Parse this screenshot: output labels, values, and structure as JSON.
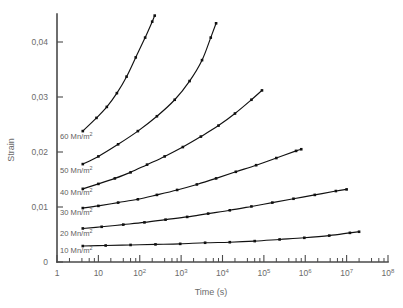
{
  "chart_data": {
    "type": "line",
    "title": "",
    "xlabel": "Time (s)",
    "ylabel": "Strain",
    "xscale": "log",
    "yscale": "linear",
    "xlim": [
      1,
      100000000
    ],
    "ylim": [
      0,
      0.045
    ],
    "xtick_labels": [
      "1",
      "10",
      "10²",
      "10³",
      "10⁴",
      "10⁵",
      "10⁶",
      "10⁷",
      "10⁸"
    ],
    "xtick_mantissas": [
      "1",
      "10",
      "10",
      "10",
      "10",
      "10",
      "10",
      "10",
      "10"
    ],
    "xtick_exponents": [
      "",
      "",
      "2",
      "3",
      "4",
      "5",
      "6",
      "7",
      "8"
    ],
    "xtick_values": [
      1,
      10,
      100,
      1000,
      10000,
      100000,
      1000000,
      10000000,
      100000000
    ],
    "ytick_labels": [
      "0",
      "0,01",
      "0,02",
      "0,03",
      "0,04"
    ],
    "ytick_values": [
      0,
      0.01,
      0.02,
      0.03,
      0.04
    ],
    "grid": false,
    "legend_position": "inline-left-of-curves",
    "marker": "square",
    "line_color": "#111111",
    "series": [
      {
        "name": "60 Mn/m²",
        "label_value": "60",
        "label_unit": "Mn/m",
        "label_exponent": "2",
        "x": [
          4.2,
          9,
          16,
          28,
          48,
          80,
          135,
          200,
          230
        ],
        "y": [
          0.0238,
          0.0262,
          0.0282,
          0.0307,
          0.0337,
          0.0372,
          0.0408,
          0.0437,
          0.0448
        ]
      },
      {
        "name": "50 Mn/m²",
        "label_value": "50",
        "label_unit": "Mn/m",
        "label_exponent": "2",
        "x": [
          4.2,
          10,
          30,
          90,
          260,
          700,
          1600,
          3200,
          5200,
          7000
        ],
        "y": [
          0.0178,
          0.0192,
          0.0214,
          0.0238,
          0.0265,
          0.0295,
          0.0329,
          0.0367,
          0.0408,
          0.0434
        ]
      },
      {
        "name": "40 Mn/m²",
        "label_value": "40",
        "label_unit": "Mn/m",
        "label_exponent": "2",
        "x": [
          4.2,
          10,
          25,
          60,
          150,
          400,
          1100,
          3000,
          8000,
          20000,
          50000,
          90000
        ],
        "y": [
          0.0133,
          0.0142,
          0.0152,
          0.0163,
          0.0177,
          0.0192,
          0.0209,
          0.0228,
          0.0248,
          0.027,
          0.0295,
          0.0312
        ]
      },
      {
        "name": "30 Mn/m²",
        "label_value": "30",
        "label_unit": "Mn/m",
        "label_exponent": "2",
        "x": [
          4.2,
          10,
          30,
          90,
          260,
          800,
          2400,
          7000,
          21000,
          65000,
          200000,
          600000,
          800000
        ],
        "y": [
          0.0098,
          0.0102,
          0.0108,
          0.0114,
          0.0122,
          0.0131,
          0.0141,
          0.0152,
          0.0164,
          0.0176,
          0.0189,
          0.0202,
          0.0205
        ]
      },
      {
        "name": "20 Mn/m²",
        "label_value": "20",
        "label_unit": "Mn/m",
        "label_exponent": "2",
        "x": [
          4.2,
          12,
          40,
          130,
          420,
          1400,
          4500,
          15000,
          50000,
          160000,
          520000,
          1700000,
          5500000,
          10000000
        ],
        "y": [
          0.0061,
          0.0064,
          0.0068,
          0.0072,
          0.0077,
          0.0082,
          0.0088,
          0.0094,
          0.0101,
          0.0108,
          0.0115,
          0.0122,
          0.0129,
          0.0132
        ]
      },
      {
        "name": "10 Mn/m²",
        "label_value": "10",
        "label_unit": "Mn/m",
        "label_exponent": "2",
        "x": [
          4.2,
          15,
          60,
          240,
          950,
          3800,
          15000,
          60000,
          240000,
          950000,
          3800000,
          12000000,
          20000000
        ],
        "y": [
          0.0029,
          0.003,
          0.0031,
          0.0032,
          0.0033,
          0.0035,
          0.0036,
          0.0038,
          0.0041,
          0.0044,
          0.0048,
          0.0053,
          0.0055
        ]
      }
    ]
  }
}
